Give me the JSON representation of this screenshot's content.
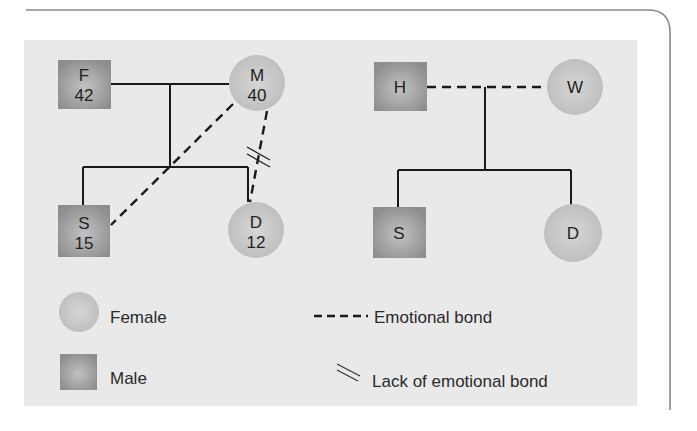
{
  "colors": {
    "panel_bg": "#e9e9e9",
    "male_fill": "#9b9b9b",
    "female_fill": "#c4c4c4",
    "line": "#1a1a1a",
    "frame": "#8a8a8a"
  },
  "left_family": {
    "father": {
      "label": "F",
      "age": "42",
      "shape": "square"
    },
    "mother": {
      "label": "M",
      "age": "40",
      "shape": "circle"
    },
    "son": {
      "label": "S",
      "age": "15",
      "shape": "square"
    },
    "daughter": {
      "label": "D",
      "age": "12",
      "shape": "circle"
    },
    "relations": [
      {
        "from": "F",
        "to": "M",
        "type": "marriage"
      },
      {
        "from": "M",
        "to": "S",
        "type": "emotional-bond"
      },
      {
        "from": "M",
        "to": "D",
        "type": "emotional-bond",
        "marker": "lack-of-emotional-bond"
      }
    ]
  },
  "right_family": {
    "husband": {
      "label": "H",
      "shape": "square"
    },
    "wife": {
      "label": "W",
      "shape": "circle"
    },
    "son": {
      "label": "S",
      "shape": "square"
    },
    "daughter": {
      "label": "D",
      "shape": "circle"
    },
    "relations": [
      {
        "from": "H",
        "to": "W",
        "type": "emotional-bond"
      }
    ]
  },
  "legend": {
    "female": "Female",
    "male": "Male",
    "emotional_bond": "Emotional bond",
    "lack_of_emotional_bond": "Lack of emotional bond"
  }
}
